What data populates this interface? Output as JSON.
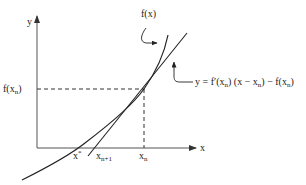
{
  "diagram": {
    "axes": {
      "x_label": "x",
      "y_label": "y"
    },
    "labels": {
      "f_x_n": {
        "base": "f(x",
        "sub": "n",
        "close": ")"
      },
      "x_n": {
        "base": "x",
        "sub": "n"
      },
      "x_n_plus_1": {
        "base": "x",
        "sub": "n+1"
      },
      "x_star": {
        "base": "x",
        "sup": "*"
      },
      "curve": "f(x)",
      "tangent_equation": {
        "p1": "y = f′(x",
        "s1": "n",
        "p2": ") (x − x",
        "s2": "n",
        "p3": ") − f(x",
        "s3": "n",
        "p4": ")"
      }
    },
    "colors": {
      "line": "#222222",
      "axis": "#555555",
      "background": "#ffffff"
    }
  }
}
